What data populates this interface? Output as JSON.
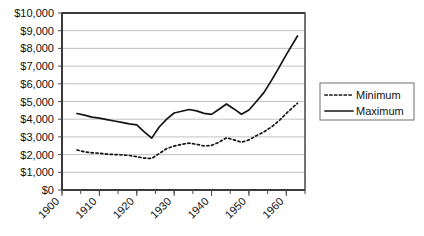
{
  "chart_data": {
    "type": "line",
    "title": "",
    "xlabel": "",
    "ylabel": "",
    "xlim": [
      1900,
      1965
    ],
    "ylim": [
      0,
      10000
    ],
    "grid": true,
    "legend_position": "right",
    "y_ticks": [
      0,
      1000,
      2000,
      3000,
      4000,
      5000,
      6000,
      7000,
      8000,
      9000,
      10000
    ],
    "y_tick_labels": [
      "$0",
      "$1,000",
      "$2,000",
      "$3,000",
      "$4,000",
      "$5,000",
      "$6,000",
      "$7,000",
      "$8,000",
      "$9,000",
      "$10,000"
    ],
    "x_ticks": [
      1900,
      1910,
      1920,
      1930,
      1940,
      1950,
      1960
    ],
    "x_tick_labels": [
      "1900",
      "1910",
      "1920",
      "1930",
      "1940",
      "1950",
      "1960"
    ],
    "x_minor_tick_step": 5,
    "x": [
      1904,
      1906,
      1908,
      1910,
      1912,
      1914,
      1916,
      1918,
      1920,
      1922,
      1924,
      1926,
      1928,
      1930,
      1932,
      1934,
      1936,
      1938,
      1940,
      1942,
      1944,
      1946,
      1948,
      1950,
      1952,
      1954,
      1956,
      1958,
      1960,
      1963
    ],
    "series": [
      {
        "name": "Maximum",
        "style": "solid",
        "color": "#141414",
        "values": [
          4320,
          4230,
          4120,
          4060,
          3980,
          3900,
          3820,
          3740,
          3680,
          3280,
          2930,
          3560,
          4000,
          4350,
          4450,
          4550,
          4470,
          4330,
          4270,
          4560,
          4860,
          4580,
          4280,
          4520,
          5000,
          5500,
          6180,
          6900,
          7650,
          8700
        ]
      },
      {
        "name": "Minimum",
        "style": "dotted",
        "color": "#141414",
        "values": [
          2260,
          2160,
          2100,
          2080,
          2030,
          2000,
          1990,
          1950,
          1880,
          1800,
          1780,
          2060,
          2340,
          2480,
          2580,
          2650,
          2580,
          2490,
          2520,
          2700,
          2950,
          2830,
          2700,
          2830,
          3070,
          3280,
          3560,
          3900,
          4330,
          4900
        ]
      }
    ]
  },
  "legend": {
    "items": [
      {
        "label": "Minimum",
        "style": "dotted"
      },
      {
        "label": "Maximum",
        "style": "solid"
      }
    ]
  }
}
